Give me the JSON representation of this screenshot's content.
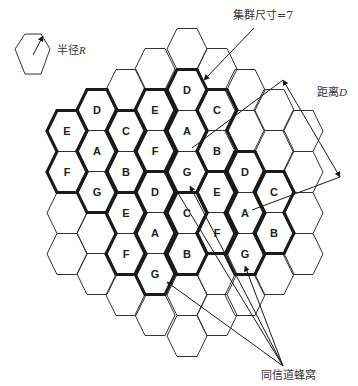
{
  "diagram": {
    "colors": {
      "line": "#333333",
      "thick": "#1a1a1a",
      "text": "#222222",
      "background": "#ffffff"
    },
    "grid": {
      "col_x": [
        67,
        97,
        126,
        155,
        187,
        217,
        245,
        274,
        303
      ],
      "half_width": 20,
      "half_top": 10,
      "half_height": 20.5,
      "columns": [
        {
          "col": 0,
          "ys": [
            131,
            172,
            213,
            254
          ]
        },
        {
          "col": 1,
          "ys": [
            110,
            151,
            192,
            233,
            274
          ]
        },
        {
          "col": 2,
          "ys": [
            90,
            131,
            172,
            213,
            254,
            295
          ]
        },
        {
          "col": 3,
          "ys": [
            69,
            110,
            151,
            192,
            233,
            274,
            315
          ]
        },
        {
          "col": 4,
          "ys": [
            49,
            90,
            131,
            172,
            213,
            254,
            295,
            336
          ]
        },
        {
          "col": 5,
          "ys": [
            69,
            110,
            151,
            192,
            233,
            274,
            315
          ]
        },
        {
          "col": 6,
          "ys": [
            90,
            131,
            172,
            213,
            254,
            295
          ]
        },
        {
          "col": 7,
          "ys": [
            110,
            151,
            192,
            233,
            274
          ]
        },
        {
          "col": 8,
          "ys": [
            131,
            172,
            213,
            254
          ]
        }
      ]
    },
    "clusters": [
      {
        "id": 1,
        "cells": [
          {
            "col": 1,
            "y": 110,
            "label": "D"
          },
          {
            "col": 0,
            "y": 131,
            "label": "E"
          },
          {
            "col": 2,
            "y": 131,
            "label": "C"
          },
          {
            "col": 1,
            "y": 151,
            "label": "A"
          },
          {
            "col": 0,
            "y": 172,
            "label": "F"
          },
          {
            "col": 2,
            "y": 172,
            "label": "B"
          },
          {
            "col": 1,
            "y": 192,
            "label": "G"
          }
        ]
      },
      {
        "id": 2,
        "cells": [
          {
            "col": 4,
            "y": 90,
            "label": "D"
          },
          {
            "col": 3,
            "y": 110,
            "label": "E"
          },
          {
            "col": 5,
            "y": 110,
            "label": "C"
          },
          {
            "col": 4,
            "y": 131,
            "label": "A"
          },
          {
            "col": 3,
            "y": 151,
            "label": "F"
          },
          {
            "col": 5,
            "y": 151,
            "label": "B"
          },
          {
            "col": 4,
            "y": 172,
            "label": "G"
          }
        ]
      },
      {
        "id": 3,
        "cells": [
          {
            "col": 3,
            "y": 192,
            "label": "D"
          },
          {
            "col": 2,
            "y": 213,
            "label": "E"
          },
          {
            "col": 4,
            "y": 213,
            "label": "C"
          },
          {
            "col": 3,
            "y": 233,
            "label": "A"
          },
          {
            "col": 2,
            "y": 254,
            "label": "F"
          },
          {
            "col": 4,
            "y": 254,
            "label": "B"
          },
          {
            "col": 3,
            "y": 274,
            "label": "G"
          }
        ]
      },
      {
        "id": 4,
        "cells": [
          {
            "col": 6,
            "y": 172,
            "label": "D"
          },
          {
            "col": 5,
            "y": 192,
            "label": "E"
          },
          {
            "col": 7,
            "y": 192,
            "label": "C"
          },
          {
            "col": 6,
            "y": 213,
            "label": "A"
          },
          {
            "col": 5,
            "y": 233,
            "label": "F"
          },
          {
            "col": 7,
            "y": 233,
            "label": "B"
          },
          {
            "col": 6,
            "y": 254,
            "label": "G"
          }
        ]
      }
    ],
    "legend": {
      "radius_label": "半径",
      "radius_var": "R",
      "cluster_label": "集群尺寸=7",
      "distance_label": "距离",
      "distance_var": "D",
      "cochannel_label": "同信道蜂窝"
    },
    "arrows": [
      {
        "name": "radius-arrow",
        "from": [
          33,
          55
        ],
        "to": [
          43,
          36
        ]
      },
      {
        "name": "cluster-size-arrow",
        "from": [
          254,
          28
        ],
        "to": [
          204,
          80
        ]
      },
      {
        "name": "distance-line-a",
        "from": [
          192,
          148
        ],
        "to": [
          283,
          80
        ]
      },
      {
        "name": "distance-double-arrow",
        "from": [
          283,
          80
        ],
        "to": [
          340,
          177
        ]
      },
      {
        "name": "distance-line-b",
        "from": [
          252,
          210
        ],
        "to": [
          340,
          177
        ]
      },
      {
        "name": "cochannel-arrow-1",
        "from": [
          283,
          366
        ],
        "to": [
          167,
          282
        ]
      },
      {
        "name": "cochannel-arrow-2",
        "from": [
          283,
          366
        ],
        "to": [
          190,
          186
        ]
      },
      {
        "name": "cochannel-arrow-3",
        "from": [
          283,
          366
        ],
        "to": [
          245,
          266
        ]
      },
      {
        "name": "cochannel-line-4",
        "from": [
          283,
          366
        ],
        "to": [
          170,
          180
        ]
      }
    ]
  }
}
